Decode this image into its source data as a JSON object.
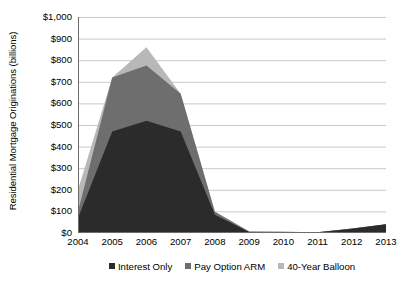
{
  "chart_data": {
    "type": "area",
    "stacked": true,
    "title": "",
    "subtitle": "",
    "xlabel": "",
    "ylabel": "Residential Mortgage Originations (billions)",
    "categories": [
      "2004",
      "2005",
      "2006",
      "2007",
      "2008",
      "2009",
      "2010",
      "2011",
      "2012",
      "2013"
    ],
    "x": [
      2004,
      2005,
      2006,
      2007,
      2008,
      2009,
      2010,
      2011,
      2012,
      2013
    ],
    "series": [
      {
        "name": "Interest Only",
        "color": "#2b2b2b",
        "values": [
          70,
          470,
          520,
          470,
          85,
          5,
          5,
          3,
          20,
          40
        ]
      },
      {
        "name": "Pay Option ARM",
        "color": "#6e6e6e",
        "values": [
          30,
          250,
          255,
          175,
          13,
          2,
          1,
          1,
          1,
          1
        ]
      },
      {
        "name": "40-Year Balloon",
        "color": "#b8b8b8",
        "values": [
          100,
          0,
          85,
          0,
          0,
          0,
          0,
          0,
          0,
          0
        ]
      }
    ],
    "totals": [
      200,
      720,
      860,
      645,
      98,
      7,
      6,
      4,
      21,
      41
    ],
    "ylim": [
      0,
      1000
    ],
    "ytick_values": [
      0,
      100,
      200,
      300,
      400,
      500,
      600,
      700,
      800,
      900,
      1000
    ],
    "ytick_labels": [
      "$0",
      "$100",
      "$200",
      "$300",
      "$400",
      "$500",
      "$600",
      "$700",
      "$800",
      "$900",
      "$1,000"
    ],
    "grid": true,
    "grid_axis": "y",
    "grid_color": "#c9c9c9",
    "legend_position": "bottom",
    "legend_entries": [
      "Interest Only",
      "Pay Option ARM",
      "40-Year Balloon"
    ],
    "axis_color": "#6b6b6b",
    "background": "#ffffff"
  }
}
